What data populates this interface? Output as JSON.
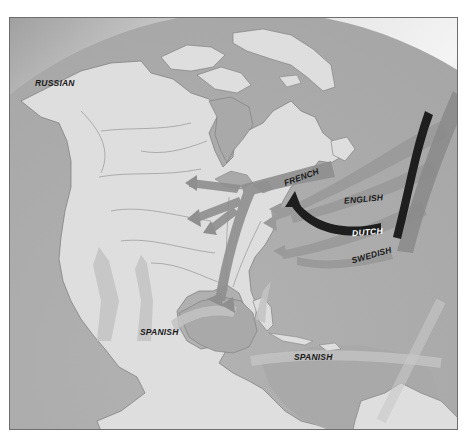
{
  "map": {
    "title": "European colonization of North America",
    "colors": {
      "ocean": "#a9a9a9",
      "land": "#dedede",
      "space_light": "#ffffff",
      "space_dark": "#8a8a8a",
      "arrow_medium": "#9a9a9a",
      "arrow_dark": "#8c8c8c",
      "dutch_arrow": "#1e1e1e",
      "border_lines": "#7a7a7a"
    },
    "labels": [
      {
        "id": "russian",
        "text": "RUSSIAN",
        "x": 34,
        "y": 77,
        "rotate": 0
      },
      {
        "id": "french",
        "text": "FRENCH",
        "x": 282,
        "y": 176,
        "rotate": -20
      },
      {
        "id": "english",
        "text": "ENGLISH",
        "x": 343,
        "y": 193,
        "rotate": -5
      },
      {
        "id": "dutch",
        "text": "DUTCH",
        "x": 351,
        "y": 226,
        "rotate": -5
      },
      {
        "id": "swedish",
        "text": "SWEDISH",
        "x": 350,
        "y": 250,
        "rotate": -16
      },
      {
        "id": "spanish-west",
        "text": "SPANISH",
        "x": 139,
        "y": 326,
        "rotate": 0
      },
      {
        "id": "spanish-caribbean",
        "text": "SPANISH",
        "x": 293,
        "y": 351,
        "rotate": 0
      }
    ],
    "legend_groups": [
      "RUSSIAN",
      "FRENCH",
      "ENGLISH",
      "DUTCH",
      "SWEDISH",
      "SPANISH"
    ]
  }
}
